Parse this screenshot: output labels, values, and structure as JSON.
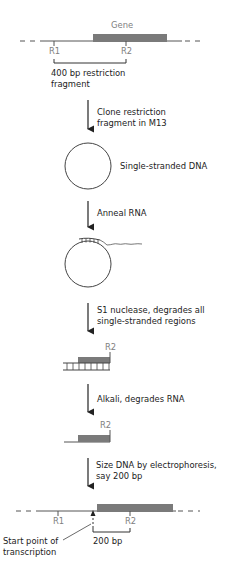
{
  "colors": {
    "gene_box": "#7a7a7a",
    "line": "#333333",
    "site_label": "#808080",
    "text": "#222222"
  },
  "panel_top": {
    "gene_label": "Gene",
    "site_r1": "R1",
    "site_r2": "R2",
    "fragment_label_line1": "400 bp restriction",
    "fragment_label_line2": "fragment"
  },
  "steps": [
    {
      "line1": "Clone restriction",
      "line2": "fragment in M13"
    },
    {
      "line1": "Anneal RNA"
    },
    {
      "line1": "S1 nuclease, degrades all",
      "line2": "single-stranded regions"
    },
    {
      "line1": "Alkali, degrades RNA"
    },
    {
      "line1": "Size DNA by electrophoresis,",
      "line2": "say 200 bp"
    }
  ],
  "circle_label": "Single-stranded DNA",
  "hybrid_site_label": "R2",
  "dna_site_label": "R2",
  "panel_bottom": {
    "site_r1": "R1",
    "site_r2": "R2",
    "start_label_line1": "Start point of",
    "start_label_line2": "transcription",
    "size_label": "200 bp"
  }
}
